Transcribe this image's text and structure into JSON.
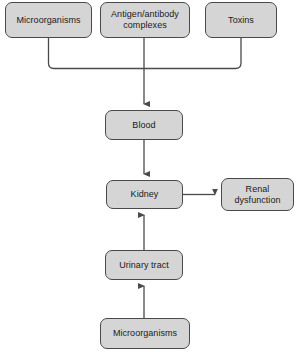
{
  "diagram": {
    "background_color": "#ffffff",
    "node_fill_color": "#d5d5d5",
    "node_border_color": "#4a4a4a",
    "connector_color": "#4a4a4a",
    "nodes": [
      {
        "id": "microorganisms-top",
        "label": "Microorganisms",
        "x": 5,
        "y": 2,
        "w": 87,
        "h": 36
      },
      {
        "id": "antigen-antibody",
        "label": "Antigen/antibody\ncomplexes",
        "x": 100,
        "y": 2,
        "w": 90,
        "h": 36
      },
      {
        "id": "toxins",
        "label": "Toxins",
        "x": 205,
        "y": 2,
        "w": 72,
        "h": 36
      },
      {
        "id": "blood",
        "label": "Blood",
        "x": 105,
        "y": 110,
        "w": 78,
        "h": 30
      },
      {
        "id": "kidney",
        "label": "Kidney",
        "x": 106,
        "y": 180,
        "w": 77,
        "h": 29
      },
      {
        "id": "renal-dysfunction",
        "label": "Renal\ndysfunction",
        "x": 221,
        "y": 178,
        "w": 73,
        "h": 33
      },
      {
        "id": "urinary-tract",
        "label": "Urinary tract",
        "x": 105,
        "y": 250,
        "w": 78,
        "h": 30
      },
      {
        "id": "microorganisms-bottom",
        "label": "Microorganisms",
        "x": 100,
        "y": 318,
        "w": 90,
        "h": 31
      }
    ],
    "connectors": [
      {
        "id": "microorganisms-top-to-junction",
        "from": "microorganisms-top",
        "to": "junction",
        "arrowhead": false
      },
      {
        "id": "antigen-antibody-to-blood",
        "from": "antigen-antibody",
        "to": "blood",
        "arrowhead": true,
        "direction": "down"
      },
      {
        "id": "toxins-to-junction",
        "from": "toxins",
        "to": "junction",
        "arrowhead": false
      },
      {
        "id": "blood-to-kidney",
        "from": "blood",
        "to": "kidney",
        "arrowhead": true,
        "direction": "down"
      },
      {
        "id": "kidney-to-renal-dysfunction",
        "from": "kidney",
        "to": "renal-dysfunction",
        "arrowhead": true,
        "direction": "right"
      },
      {
        "id": "urinary-tract-to-kidney",
        "from": "urinary-tract",
        "to": "kidney",
        "arrowhead": true,
        "direction": "up"
      },
      {
        "id": "microorganisms-bottom-to-urinary-tract",
        "from": "microorganisms-bottom",
        "to": "urinary-tract",
        "arrowhead": true,
        "direction": "up"
      }
    ]
  }
}
